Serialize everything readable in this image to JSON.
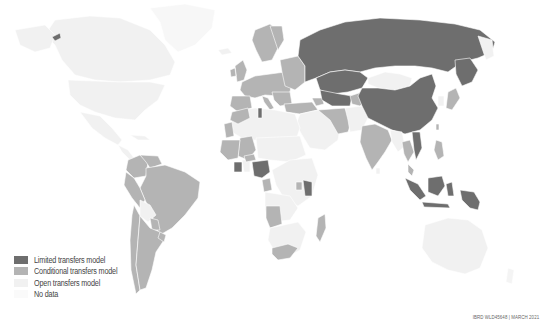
{
  "map": {
    "type": "choropleth-world",
    "colors": {
      "limited": "#6e6e6e",
      "conditional": "#b4b4b4",
      "open": "#f1f1f1",
      "no_data": "#fafafa",
      "border": "#ffffff"
    }
  },
  "legend": {
    "items": [
      {
        "label": "Limited transfers model",
        "color": "#6e6e6e"
      },
      {
        "label": "Conditional transfers model",
        "color": "#b4b4b4"
      },
      {
        "label": "Open transfers model",
        "color": "#f1f1f1"
      },
      {
        "label": "No data",
        "color": "#fafafa"
      }
    ]
  },
  "credit": "IBRD WLD45648 | MARCH 2021",
  "regions": {
    "limited": [
      "Russia",
      "Kazakhstan",
      "China",
      "Nigeria",
      "Côte d'Ivoire",
      "Kenya",
      "Indonesia",
      "Vietnam",
      "Turkmenistan",
      "Papua New Guinea region",
      "Tunisia"
    ],
    "conditional": [
      "Europe",
      "Turkey",
      "Middle East (parts)",
      "India",
      "Brazil",
      "Peru",
      "Colombia",
      "Argentina",
      "Chile",
      "Angola",
      "South Africa",
      "Madagascar",
      "Mali",
      "Morocco",
      "Cameroon",
      "Japan",
      "Thailand",
      "Malaysia"
    ],
    "open": [
      "United States",
      "Canada",
      "Mexico",
      "Bolivia",
      "Mongolia",
      "Australia",
      "Most of Africa",
      "Saudi Arabia"
    ]
  }
}
